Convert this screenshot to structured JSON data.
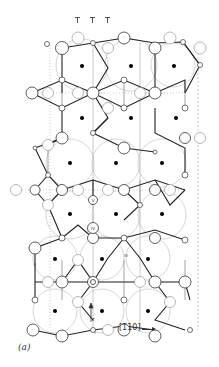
{
  "figure": {
    "panel_label": "(a)",
    "direction_label": "[1̄10]",
    "axis_label": "z",
    "site_labels": [
      "V",
      "IV",
      "III",
      "II",
      "I"
    ],
    "colors": {
      "bond_strong": "#222222",
      "bond_thin": "#555555",
      "guide_line": "#999999",
      "atom_outline": "#333333",
      "atom_light_outline": "#aaaaaa",
      "center_dot": "#000000",
      "background": "#ffffff"
    },
    "legend_ticks": 3
  }
}
